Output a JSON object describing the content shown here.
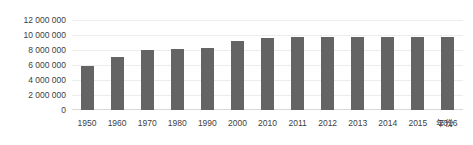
{
  "chart_data": {
    "type": "bar",
    "title": "",
    "xlabel": "年份",
    "ylabel": "",
    "categories": [
      "1950",
      "1960",
      "1970",
      "1980",
      "1990",
      "2000",
      "2010",
      "2011",
      "2012",
      "2013",
      "2014",
      "2015",
      "2016"
    ],
    "values": [
      5900000,
      7100000,
      8000000,
      8200000,
      8300000,
      9200000,
      9550000,
      9750000,
      9750000,
      9750000,
      9750000,
      9750000,
      9700000
    ],
    "ylim": [
      0,
      12000000
    ],
    "yticks": [
      0,
      2000000,
      4000000,
      6000000,
      8000000,
      10000000,
      12000000
    ],
    "ytick_labels": [
      "0",
      "2 000 000",
      "4 000 000",
      "6 000 000",
      "8 000 000",
      "10 000 000",
      "12 000 000"
    ],
    "grid": true,
    "legend": false,
    "bar_color": "#646464",
    "gridline_color": "#ececed",
    "axis_color": "#d9d9d9",
    "text_color": "#404040"
  }
}
